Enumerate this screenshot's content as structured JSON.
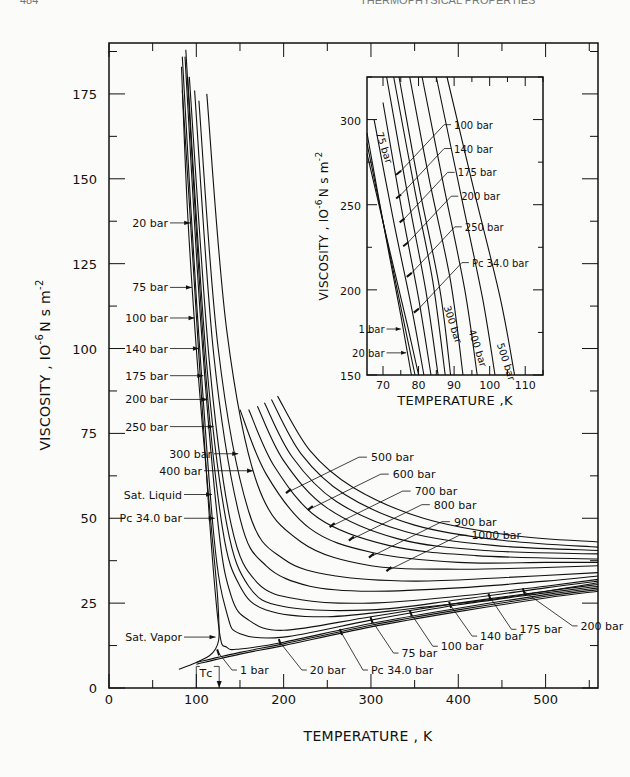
{
  "page": {
    "header_left": "484",
    "header_right": "THERMOPHYSICAL PROPERTIES"
  },
  "chart_data": [
    {
      "id": "main",
      "type": "line",
      "title": "",
      "xlabel": "TEMPERATURE , K",
      "ylabel": "VISCOSITY , 10^-6 N s m^-2",
      "ylabel_main": "VISCOSITY , IO",
      "ylabel_exp1": "-6",
      "ylabel_unit": "N s m",
      "ylabel_exp2": "-2",
      "xlim": [
        0,
        560
      ],
      "ylim": [
        0,
        190
      ],
      "x_ticks": [
        0,
        100,
        200,
        300,
        400,
        500
      ],
      "x_tick_labels": [
        "0",
        "100",
        "200",
        "300",
        "400",
        "500"
      ],
      "y_ticks": [
        0,
        25,
        50,
        75,
        100,
        125,
        150,
        175
      ],
      "y_tick_labels": [
        "0",
        "25",
        "50",
        "75",
        "100",
        "125",
        "150",
        "175"
      ],
      "grid": false,
      "legend": "none (curves labeled directly)",
      "annotations": [
        {
          "text": "20 bar",
          "side": "left",
          "y": 137
        },
        {
          "text": "75 bar",
          "side": "left",
          "y": 118
        },
        {
          "text": "100 bar",
          "side": "left",
          "y": 109
        },
        {
          "text": "140 bar",
          "side": "left",
          "y": 100
        },
        {
          "text": "175 bar",
          "side": "left",
          "y": 92
        },
        {
          "text": "200 bar",
          "side": "left",
          "y": 85
        },
        {
          "text": "250 bar",
          "side": "left",
          "y": 77
        },
        {
          "text": "300 bar",
          "side": "left",
          "y": 69
        },
        {
          "text": "400 bar",
          "side": "left",
          "y": 64
        },
        {
          "text": "Sat. Liquid",
          "side": "left",
          "y": 57
        },
        {
          "text": "P_C 34.0 bar",
          "side": "left",
          "y": 50
        },
        {
          "text": "Sat. Vapor",
          "side": "left",
          "y": 15
        },
        {
          "text": "500 bar",
          "side": "right",
          "x": 300,
          "y": 68
        },
        {
          "text": "600 bar",
          "side": "right",
          "x": 325,
          "y": 63
        },
        {
          "text": "700 bar",
          "side": "right",
          "x": 350,
          "y": 58
        },
        {
          "text": "800 bar",
          "side": "right",
          "x": 372,
          "y": 54
        },
        {
          "text": "900 bar",
          "side": "right",
          "x": 395,
          "y": 49
        },
        {
          "text": "1000 bar",
          "side": "right",
          "x": 415,
          "y": 45
        },
        {
          "text": "1 bar",
          "side": "below",
          "x": 150,
          "y": 5
        },
        {
          "text": "20 bar",
          "side": "below",
          "x": 230,
          "y": 5
        },
        {
          "text": "P_C 34.0 bar",
          "side": "below",
          "x": 300,
          "y": 5
        },
        {
          "text": "75 bar",
          "side": "below",
          "x": 335,
          "y": 10
        },
        {
          "text": "100 bar",
          "side": "below",
          "x": 380,
          "y": 12
        },
        {
          "text": "140 bar",
          "side": "below",
          "x": 425,
          "y": 15
        },
        {
          "text": "175 bar",
          "side": "below",
          "x": 470,
          "y": 17
        },
        {
          "text": "200 bar",
          "side": "below",
          "x": 540,
          "y": 18
        },
        {
          "text": "T_C",
          "x": 115,
          "y": 4
        }
      ],
      "series": [
        {
          "name": "Sat. Liquid",
          "x": [
            83,
            90,
            100,
            110,
            118,
            124,
            126.2
          ],
          "y": [
            183,
            140,
            100,
            68,
            45,
            28,
            17
          ]
        },
        {
          "name": "Sat. Vapor",
          "x": [
            80,
            100,
            115,
            122,
            125.5,
            126.2
          ],
          "y": [
            5.5,
            7.5,
            9.5,
            11.5,
            14,
            17
          ]
        },
        {
          "name": "1 bar",
          "x": [
            100,
            150,
            200,
            300,
            400,
            500,
            560
          ],
          "y": [
            7,
            10,
            12.5,
            18,
            22.5,
            26.5,
            28.5
          ]
        },
        {
          "name": "20 bar",
          "x": [
            100,
            150,
            200,
            300,
            400,
            500,
            560
          ],
          "y": [
            7.5,
            10.5,
            13,
            18.5,
            23,
            27,
            29
          ]
        },
        {
          "name": "P_C 34.0 bar",
          "x": [
            84,
            100,
            115,
            126.2,
            135,
            150,
            200,
            300,
            400,
            500,
            560
          ],
          "y": [
            176,
            110,
            50,
            17,
            12,
            11.5,
            13.5,
            19,
            23.5,
            27.5,
            29.5
          ]
        },
        {
          "name": "75 bar",
          "x": [
            84,
            100,
            120,
            135,
            150,
            200,
            300,
            400,
            500,
            560
          ],
          "y": [
            186,
            115,
            45,
            22,
            16,
            15,
            20,
            24.5,
            28,
            30
          ]
        },
        {
          "name": "100 bar",
          "x": [
            87,
            105,
            125,
            140,
            160,
            200,
            300,
            400,
            500,
            560
          ],
          "y": [
            186,
            108,
            48,
            27,
            20,
            17,
            21,
            25,
            28.5,
            30.5
          ]
        },
        {
          "name": "140 bar",
          "x": [
            88,
            110,
            130,
            150,
            180,
            250,
            350,
            450,
            560
          ],
          "y": [
            188,
            95,
            47,
            30,
            23,
            21,
            23.5,
            26.5,
            31
          ]
        },
        {
          "name": "175 bar",
          "x": [
            90,
            112,
            135,
            160,
            200,
            300,
            400,
            500,
            560
          ],
          "y": [
            180,
            95,
            48,
            30,
            24,
            23,
            26,
            29.5,
            31.5
          ]
        },
        {
          "name": "200 bar",
          "x": [
            92,
            115,
            140,
            170,
            220,
            300,
            400,
            500,
            560
          ],
          "y": [
            180,
            96,
            48,
            31,
            26,
            25,
            27,
            30,
            32
          ]
        },
        {
          "name": "250 bar",
          "x": [
            98,
            120,
            150,
            180,
            230,
            300,
            400,
            500,
            560
          ],
          "y": [
            176,
            98,
            50,
            36,
            30,
            28.5,
            29.5,
            31.5,
            33
          ]
        },
        {
          "name": "300 bar",
          "x": [
            103,
            125,
            160,
            200,
            260,
            350,
            450,
            560
          ],
          "y": [
            173,
            100,
            52,
            38,
            33,
            31.5,
            32.5,
            34
          ]
        },
        {
          "name": "400 bar",
          "x": [
            112,
            135,
            170,
            220,
            300,
            400,
            500,
            560
          ],
          "y": [
            175,
            105,
            60,
            43,
            36,
            35,
            35.5,
            36
          ]
        },
        {
          "name": "500 bar",
          "x": [
            150,
            180,
            230,
            300,
            400,
            500,
            560
          ],
          "y": [
            82,
            63,
            47,
            40,
            37,
            37,
            37
          ]
        },
        {
          "name": "600 bar",
          "x": [
            160,
            190,
            240,
            320,
            420,
            560
          ],
          "y": [
            82,
            65,
            50,
            42,
            39,
            38
          ]
        },
        {
          "name": "700 bar",
          "x": [
            170,
            200,
            250,
            330,
            430,
            560
          ],
          "y": [
            83,
            67,
            53,
            44,
            40.5,
            39.5
          ]
        },
        {
          "name": "800 bar",
          "x": [
            178,
            210,
            260,
            340,
            440,
            560
          ],
          "y": [
            84,
            68,
            55,
            46,
            42,
            40.5
          ]
        },
        {
          "name": "900 bar",
          "x": [
            186,
            220,
            270,
            350,
            450,
            560
          ],
          "y": [
            85,
            69,
            57,
            48,
            43.5,
            41.5
          ]
        },
        {
          "name": "1000 bar",
          "x": [
            193,
            230,
            280,
            360,
            460,
            560
          ],
          "y": [
            86,
            70,
            59,
            50,
            45,
            43
          ]
        }
      ]
    },
    {
      "id": "inset",
      "type": "line",
      "title": "",
      "xlabel": "TEMPERATURE ,K",
      "ylabel": "VISCOSITY , 10^-6 N s m^-2",
      "ylabel_main": "VISCOSITY , IO",
      "ylabel_exp1": "-6",
      "ylabel_unit": "N s m",
      "ylabel_exp2": "-2",
      "xlim": [
        65.5,
        115
      ],
      "ylim": [
        150,
        325
      ],
      "x_ticks": [
        70,
        80,
        90,
        100,
        110
      ],
      "x_tick_labels": [
        "70",
        "80",
        "90",
        "100",
        "110"
      ],
      "y_ticks": [
        150,
        200,
        250,
        300
      ],
      "y_tick_labels": [
        "150",
        "200",
        "250",
        "300"
      ],
      "grid": false,
      "annotations": [
        {
          "text": "100 bar",
          "x": 90,
          "y": 297
        },
        {
          "text": "140 bar",
          "x": 90,
          "y": 283
        },
        {
          "text": "175 bar",
          "x": 91,
          "y": 269
        },
        {
          "text": "200 bar",
          "x": 92,
          "y": 255
        },
        {
          "text": "250 bar",
          "x": 93,
          "y": 237
        },
        {
          "text": "P_C 34.0 bar",
          "x": 95,
          "y": 216
        },
        {
          "text": "75 bar",
          "rotated": true,
          "x": 68,
          "y": 292
        },
        {
          "text": "300 bar",
          "rotated": true,
          "x": 87,
          "y": 190
        },
        {
          "text": "400 bar",
          "rotated": true,
          "x": 94,
          "y": 176
        },
        {
          "text": "500 bar",
          "rotated": true,
          "x": 102,
          "y": 168
        },
        {
          "text": "1 bar",
          "x": 71,
          "y": 177
        },
        {
          "text": "20 bar",
          "x": 71,
          "y": 163
        }
      ],
      "series": [
        {
          "name": "1 bar",
          "x": [
            65.5,
            70,
            75,
            78
          ],
          "y": [
            292,
            240,
            185,
            150
          ]
        },
        {
          "name": "20 bar",
          "x": [
            65.5,
            71,
            76,
            79
          ],
          "y": [
            286,
            230,
            180,
            150
          ]
        },
        {
          "name": "P_C 34.0 bar",
          "x": [
            65.5,
            72,
            77,
            80
          ],
          "y": [
            280,
            222,
            178,
            150
          ]
        },
        {
          "name": "75 bar",
          "x": [
            67.5,
            73,
            78,
            81.5
          ],
          "y": [
            300,
            240,
            190,
            150
          ]
        },
        {
          "name": "100 bar",
          "x": [
            70,
            75,
            80,
            83.5
          ],
          "y": [
            310,
            250,
            195,
            150
          ]
        },
        {
          "name": "140 bar",
          "x": [
            71,
            77,
            82,
            85.5
          ],
          "y": [
            325,
            255,
            200,
            150
          ]
        },
        {
          "name": "175 bar",
          "x": [
            73,
            79,
            84,
            87.5
          ],
          "y": [
            325,
            258,
            205,
            150
          ]
        },
        {
          "name": "200 bar",
          "x": [
            74.5,
            80,
            86,
            89
          ],
          "y": [
            325,
            262,
            200,
            150
          ]
        },
        {
          "name": "250 bar",
          "x": [
            77.5,
            83,
            89,
            92.5
          ],
          "y": [
            325,
            265,
            205,
            150
          ]
        },
        {
          "name": "300 bar",
          "x": [
            81,
            87,
            93,
            96.5
          ],
          "y": [
            325,
            262,
            200,
            150
          ]
        },
        {
          "name": "400 bar",
          "x": [
            85,
            92,
            98,
            101.5
          ],
          "y": [
            325,
            255,
            195,
            150
          ]
        },
        {
          "name": "500 bar",
          "x": [
            88,
            96,
            103,
            107
          ],
          "y": [
            325,
            255,
            195,
            150
          ]
        }
      ]
    }
  ]
}
